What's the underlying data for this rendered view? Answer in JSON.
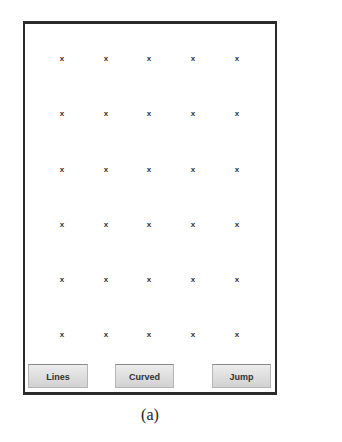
{
  "grid": {
    "rows": 6,
    "cols": 5,
    "marker": "x",
    "col_x": [
      37,
      81,
      124,
      168,
      212
    ],
    "row_y": [
      35,
      90,
      146,
      201,
      256,
      311
    ]
  },
  "buttons": [
    {
      "label": "Lines"
    },
    {
      "label": "Curved"
    },
    {
      "label": "Jump"
    }
  ],
  "caption": "(a)"
}
